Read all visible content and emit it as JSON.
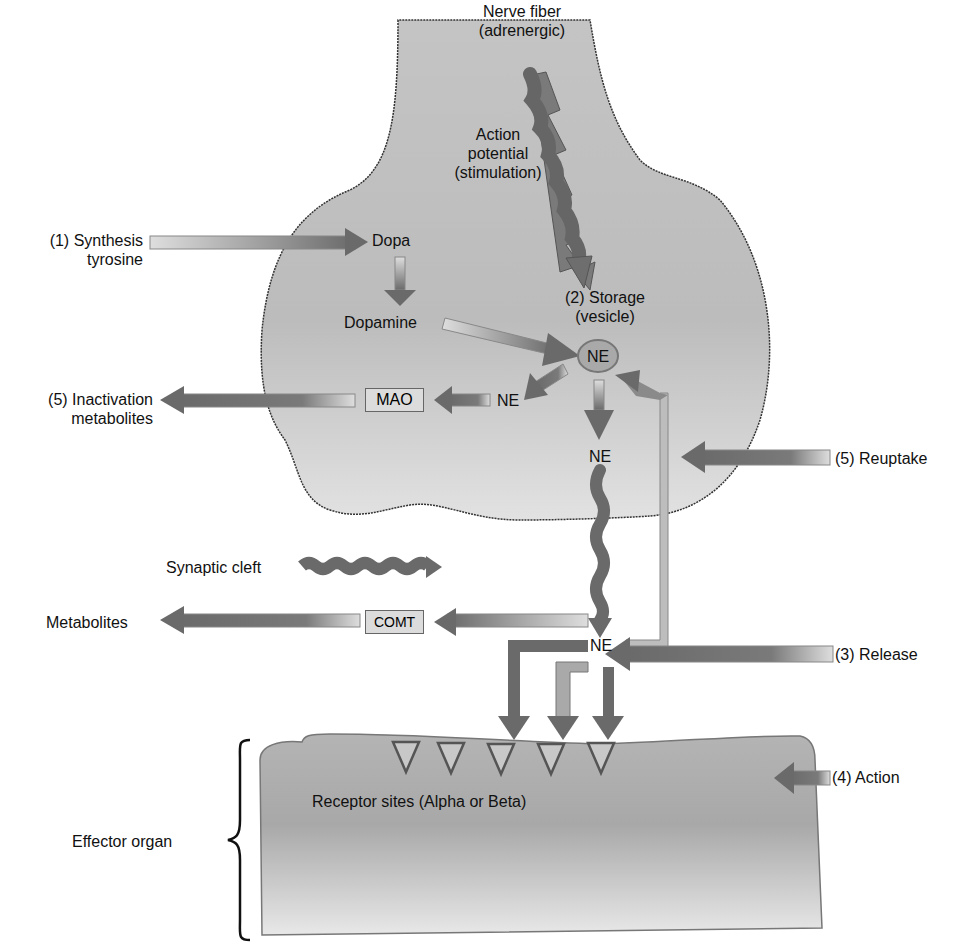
{
  "diagram": {
    "labels": {
      "nerve_fiber": "Nerve fiber (adrenergic)",
      "nerve_fiber_l1": "Nerve fiber",
      "nerve_fiber_l2": "(adrenergic)",
      "action_potential_l1": "Action",
      "action_potential_l2": "potential",
      "action_potential_l3": "(stimulation)",
      "synthesis_l1": "(1) Synthesis",
      "synthesis_l2": "tyrosine",
      "dopa": "Dopa",
      "dopamine": "Dopamine",
      "storage_l1": "(2) Storage",
      "storage_l2": "(vesicle)",
      "vesicle_ne": "NE",
      "ne_mao": "NE",
      "mao": "MAO",
      "inactivation_l1": "(5) Inactivation",
      "inactivation_l2": "metabolites",
      "ne_lower": "NE",
      "reuptake": "(5) Reuptake",
      "synaptic_cleft": "Synaptic cleft",
      "comt": "COMT",
      "metabolites": "Metabolites",
      "ne_cleft": "NE",
      "release": "(3) Release",
      "action": "(4) Action",
      "receptor_sites": "Receptor sites (Alpha or Beta)",
      "effector_organ": "Effector organ"
    },
    "colors": {
      "neuron_fill": "#bdbdbd",
      "arrow_dark": "#6e6e6e",
      "arrow_light": "#d4d4d4",
      "outline": "#444444"
    }
  }
}
